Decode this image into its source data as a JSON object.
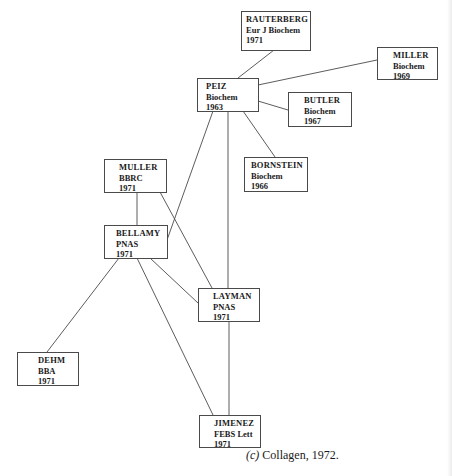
{
  "diagram": {
    "type": "citation-network",
    "caption": {
      "label": "(c)",
      "text": " Collagen, 1972."
    },
    "nodes": [
      {
        "id": "rauterberg",
        "author": "RAUTERBERG",
        "journal": "Eur J Biochem",
        "year": "1971",
        "box": {
          "x": 241,
          "y": 11,
          "w": 70,
          "h": 40,
          "pad": 4
        }
      },
      {
        "id": "miller",
        "author": "MILLER",
        "journal": "Biochem",
        "year": "1969",
        "box": {
          "x": 377,
          "y": 47,
          "w": 61,
          "h": 33,
          "pad": 15
        }
      },
      {
        "id": "peiz",
        "author": "PEIZ",
        "journal": "Biochem",
        "year": "1963",
        "box": {
          "x": 197,
          "y": 78,
          "w": 62,
          "h": 34,
          "pad": 8
        }
      },
      {
        "id": "butler",
        "author": "BUTLER",
        "journal": "Biochem",
        "year": "1967",
        "box": {
          "x": 288,
          "y": 92,
          "w": 64,
          "h": 35,
          "pad": 15
        }
      },
      {
        "id": "bornstein",
        "author": "BORNSTEIN",
        "journal": "Biochem",
        "year": "1966",
        "box": {
          "x": 244,
          "y": 157,
          "w": 64,
          "h": 35,
          "pad": 6
        }
      },
      {
        "id": "muller",
        "author": "MULLER",
        "journal": "BBRC",
        "year": "1971",
        "box": {
          "x": 104,
          "y": 159,
          "w": 63,
          "h": 34,
          "pad": 14
        }
      },
      {
        "id": "bellamy",
        "author": "BELLAMY",
        "journal": "PNAS",
        "year": "1971",
        "box": {
          "x": 104,
          "y": 225,
          "w": 64,
          "h": 34,
          "pad": 11
        }
      },
      {
        "id": "layman",
        "author": "LAYMAN",
        "journal": "PNAS",
        "year": "1971",
        "box": {
          "x": 198,
          "y": 288,
          "w": 62,
          "h": 34,
          "pad": 14
        }
      },
      {
        "id": "dehm",
        "author": "DEHM",
        "journal": "BBA",
        "year": "1971",
        "box": {
          "x": 17,
          "y": 352,
          "w": 62,
          "h": 34,
          "pad": 20
        }
      },
      {
        "id": "jimenez",
        "author": "JIMENEZ",
        "journal": "FEBS Lett",
        "year": "1971",
        "box": {
          "x": 199,
          "y": 415,
          "w": 62,
          "h": 33,
          "pad": 14
        }
      }
    ],
    "edges": [
      {
        "from": "rauterberg",
        "to": "peiz",
        "x1": 274,
        "y1": 50,
        "x2": 238,
        "y2": 78
      },
      {
        "from": "peiz",
        "to": "miller",
        "x1": 258,
        "y1": 85,
        "x2": 377,
        "y2": 60
      },
      {
        "from": "peiz",
        "to": "butler",
        "x1": 258,
        "y1": 101,
        "x2": 288,
        "y2": 110
      },
      {
        "from": "peiz",
        "to": "bornstein",
        "x1": 243,
        "y1": 111,
        "x2": 275,
        "y2": 157
      },
      {
        "from": "peiz",
        "to": "layman",
        "x1": 228,
        "y1": 111,
        "x2": 228,
        "y2": 288
      },
      {
        "from": "peiz",
        "to": "bellamy",
        "x1": 213,
        "y1": 111,
        "x2": 167,
        "y2": 240
      },
      {
        "from": "muller",
        "to": "bellamy",
        "x1": 137,
        "y1": 192,
        "x2": 137,
        "y2": 225
      },
      {
        "from": "muller",
        "to": "layman",
        "x1": 160,
        "y1": 192,
        "x2": 212,
        "y2": 288
      },
      {
        "from": "bellamy",
        "to": "dehm",
        "x1": 119,
        "y1": 258,
        "x2": 47,
        "y2": 352
      },
      {
        "from": "bellamy",
        "to": "jimenez",
        "x1": 137,
        "y1": 258,
        "x2": 213,
        "y2": 415
      },
      {
        "from": "bellamy",
        "to": "layman",
        "x1": 150,
        "y1": 258,
        "x2": 198,
        "y2": 303
      },
      {
        "from": "layman",
        "to": "jimenez",
        "x1": 229,
        "y1": 321,
        "x2": 229,
        "y2": 415
      }
    ]
  }
}
